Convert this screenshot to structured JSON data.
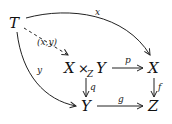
{
  "diagram": {
    "type": "commutative-diagram",
    "objects": {
      "T": "T",
      "pullback_left": "X",
      "pullback_times": "×",
      "pullback_sub": "Z",
      "pullback_right": "Y",
      "X": "X",
      "Y": "Y",
      "Z": "Z"
    },
    "morphisms": {
      "x": {
        "label": "x",
        "from": "T",
        "to": "X",
        "style": "solid-curved"
      },
      "xy": {
        "label": "(x,y)",
        "from": "T",
        "to": "X ×_Z Y",
        "style": "dashed"
      },
      "y": {
        "label": "y",
        "from": "T",
        "to": "Y",
        "style": "solid-curved"
      },
      "p": {
        "label": "p",
        "from": "X ×_Z Y",
        "to": "X",
        "style": "solid"
      },
      "q": {
        "label": "q",
        "from": "X ×_Z Y",
        "to": "Y",
        "style": "solid"
      },
      "f": {
        "label": "f",
        "from": "X",
        "to": "Z",
        "style": "solid"
      },
      "g": {
        "label": "g",
        "from": "Y",
        "to": "Z",
        "style": "solid"
      }
    },
    "colors": {
      "ink": "#111111",
      "background": "#ffffff"
    }
  }
}
